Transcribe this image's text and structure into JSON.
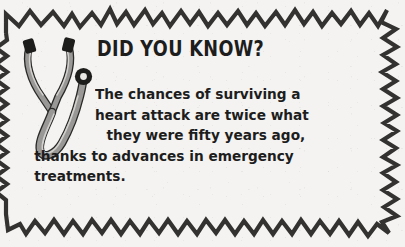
{
  "card": {
    "headline": "DID YOU KNOW?",
    "body_lines": [
      "The chances of surviving a",
      "heart attack are twice what",
      "they were fifty years ago,",
      "thanks to advances in emergency",
      "treatments."
    ],
    "full_text": "The chances of surviving a heart attack are twice what they were fifty years ago, thanks to advances in emergency treatments.",
    "illustration": "stethoscope",
    "colors": {
      "background": "#f4f3f1",
      "ink": "#1d1d1d",
      "border": "#333231",
      "tube_gray": "#9a9896",
      "tube_highlight": "#cfcdca"
    }
  }
}
